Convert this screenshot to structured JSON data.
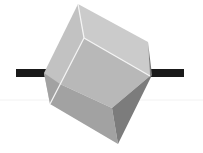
{
  "figure": {
    "colors": {
      "background": "#ffffff",
      "axle": "#1a1a1a",
      "face_top_left": "#c4c4c4",
      "face_top_right": "#cdcdcd",
      "face_front": "#b4b4b4",
      "face_lower": "#9d9d9d",
      "face_right_dark": "#7a7a7a",
      "edge_highlight": "#f4f4f4"
    }
  }
}
